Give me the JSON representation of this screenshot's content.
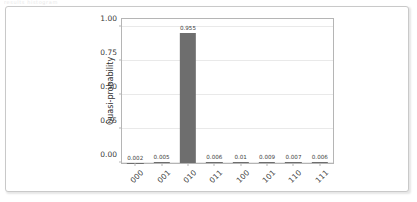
{
  "artifact": {
    "text": "results histogram"
  },
  "chart_data": {
    "type": "bar",
    "title": "",
    "xlabel": "",
    "ylabel": "Quasi-probability",
    "categories": [
      "000",
      "001",
      "010",
      "011",
      "100",
      "101",
      "110",
      "111"
    ],
    "values": [
      0.002,
      0.005,
      0.955,
      0.006,
      0.01,
      0.009,
      0.007,
      0.006
    ],
    "value_labels": [
      "0.002",
      "0.005",
      "0.955",
      "0.006",
      "0.01",
      "0.009",
      "0.007",
      "0.006"
    ],
    "ylim": [
      0,
      1.06
    ],
    "yticks": [
      0.0,
      0.25,
      0.5,
      0.75,
      1.0
    ],
    "ytick_labels": [
      "0.00",
      "0.25",
      "0.50",
      "0.75",
      "1.00"
    ],
    "grid": true,
    "legend": false,
    "bar_color": "#6e6e6e",
    "grid_color": "#e9e9e9",
    "axis_color": "#b5b5b5"
  }
}
